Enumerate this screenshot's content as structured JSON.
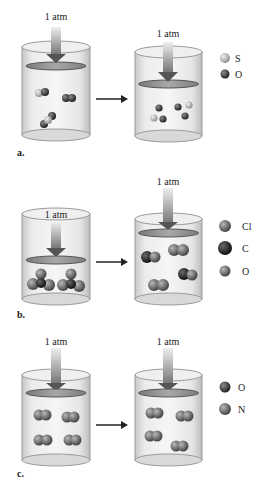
{
  "figure": {
    "panels": [
      {
        "id": "a",
        "label": "a.",
        "before": {
          "pressure_label": "1 atm",
          "molecules": [
            {
              "atoms": [
                "S",
                "O"
              ]
            },
            {
              "atoms": [
                "O",
                "O"
              ]
            },
            {
              "atoms": [
                "O",
                "S"
              ]
            }
          ]
        },
        "after": {
          "pressure_label": "1 atm",
          "molecules": [
            {
              "atoms": [
                "O",
                "S",
                "O"
              ]
            },
            {
              "atoms": [
                "O",
                "S",
                "O"
              ]
            }
          ]
        },
        "legend": [
          {
            "symbol": "S",
            "color": "#b5b5b5"
          },
          {
            "symbol": "O",
            "color": "#3a3a3a"
          }
        ]
      },
      {
        "id": "b",
        "label": "b.",
        "before": {
          "pressure_label": "1 atm",
          "molecules": [
            {
              "atoms": [
                "Cl",
                "C",
                "Cl",
                "O"
              ]
            },
            {
              "atoms": [
                "Cl",
                "C",
                "Cl",
                "O"
              ]
            }
          ]
        },
        "after": {
          "pressure_label": "1 atm",
          "molecules": [
            {
              "atoms": [
                "C",
                "O"
              ]
            },
            {
              "atoms": [
                "Cl",
                "Cl"
              ]
            },
            {
              "atoms": [
                "C",
                "O"
              ]
            },
            {
              "atoms": [
                "Cl",
                "Cl"
              ]
            }
          ]
        },
        "legend": [
          {
            "symbol": "Cl",
            "color": "#6a6a6a"
          },
          {
            "symbol": "C",
            "color": "#1e1e1e"
          },
          {
            "symbol": "O",
            "color": "#4a4a4a"
          }
        ]
      },
      {
        "id": "c",
        "label": "c.",
        "before": {
          "pressure_label": "1 atm",
          "molecules": [
            {
              "atoms": [
                "O",
                "O"
              ]
            },
            {
              "atoms": [
                "N",
                "N"
              ]
            },
            {
              "atoms": [
                "O",
                "O"
              ]
            },
            {
              "atoms": [
                "N",
                "N"
              ]
            }
          ]
        },
        "after": {
          "pressure_label": "1 atm",
          "molecules": [
            {
              "atoms": [
                "N",
                "O"
              ]
            },
            {
              "atoms": [
                "N",
                "O"
              ]
            },
            {
              "atoms": [
                "N",
                "O"
              ]
            },
            {
              "atoms": [
                "N",
                "O"
              ]
            }
          ]
        },
        "legend": [
          {
            "symbol": "O",
            "color": "#3c3c3c"
          },
          {
            "symbol": "N",
            "color": "#555555"
          }
        ]
      }
    ]
  }
}
